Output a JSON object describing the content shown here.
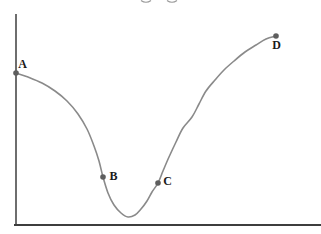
{
  "window": {
    "width": 321,
    "height": 234,
    "background": "#ffffff"
  },
  "chart_data": {
    "type": "line",
    "title": "",
    "xlabel": "",
    "ylabel": "",
    "grid": false,
    "legend": false,
    "x_axis": {
      "label": "",
      "tick_labels": [],
      "color": "#3d3d3d",
      "stroke_width": 2.2,
      "y_px": 225,
      "x1_px": 14,
      "x2_px": 321
    },
    "y_axis": {
      "label": "",
      "tick_labels": [],
      "color": "#4a4a4a",
      "stroke_width": 1.6,
      "x_px": 16,
      "y1_px": 14,
      "y2_px": 226
    },
    "curve": {
      "color": "#8a8a8a",
      "stroke_width": 1.6,
      "points_px": [
        [
          16,
          73
        ],
        [
          28,
          77
        ],
        [
          42,
          83
        ],
        [
          55,
          91
        ],
        [
          67,
          101
        ],
        [
          78,
          114
        ],
        [
          87,
          129
        ],
        [
          94,
          146
        ],
        [
          99,
          161
        ],
        [
          103,
          177
        ],
        [
          108,
          193
        ],
        [
          114,
          205
        ],
        [
          121,
          213
        ],
        [
          128,
          217
        ],
        [
          135,
          215
        ],
        [
          141,
          209
        ],
        [
          147,
          201
        ],
        [
          152,
          192
        ],
        [
          158,
          183
        ],
        [
          163,
          171
        ],
        [
          169,
          157
        ],
        [
          176,
          142
        ],
        [
          183,
          128
        ],
        [
          192,
          117
        ],
        [
          199,
          104
        ],
        [
          206,
          91
        ],
        [
          215,
          80
        ],
        [
          224,
          70
        ],
        [
          234,
          61
        ],
        [
          245,
          52
        ],
        [
          256,
          45
        ],
        [
          266,
          39
        ],
        [
          276,
          36
        ]
      ]
    },
    "marked_points": [
      {
        "label": "A",
        "x_px": 16,
        "y_px": 73,
        "label_dx": 6.5,
        "label_dy": -5
      },
      {
        "label": "B",
        "x_px": 103,
        "y_px": 177,
        "label_dx": 10.5,
        "label_dy": 3
      },
      {
        "label": "C",
        "x_px": 158,
        "y_px": 183,
        "label_dx": 9.5,
        "label_dy": 2
      },
      {
        "label": "D",
        "x_px": 276,
        "y_px": 36,
        "label_dx": 0.5,
        "label_dy": 13
      }
    ],
    "point_style": {
      "radius": 2.8,
      "color": "#5e5e5e"
    },
    "label_style": {
      "color": "#1a1a1a",
      "font_size_px": 12
    }
  },
  "artifacts": {
    "cropped_top_text": {
      "color": "#9a9a9a",
      "fragment_x_ranges_px": [
        [
          141,
          151
        ],
        [
          167,
          177
        ]
      ]
    }
  }
}
